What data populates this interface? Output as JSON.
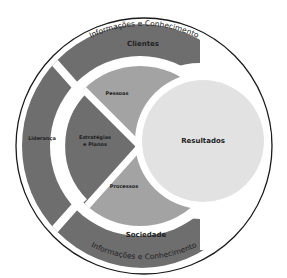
{
  "diagram": {
    "outer_label_top": "Informações e Conhecimento",
    "outer_label_bottom": "Informações e Conhecimento",
    "segments": {
      "clientes": "Clientes",
      "sociedade": "Sociedade",
      "lideranca": "Liderança",
      "estrategias_line1": "Estratégias",
      "estrategias_line2": "e Planos",
      "pessoas": "Pessoas",
      "processos": "Processos",
      "resultados": "Resultados"
    },
    "colors": {
      "dark": "#6e6e6e",
      "medium": "#a3a3a3",
      "light": "#e2e2e2",
      "outline": "#1a1a1a",
      "background": "#ffffff"
    }
  }
}
